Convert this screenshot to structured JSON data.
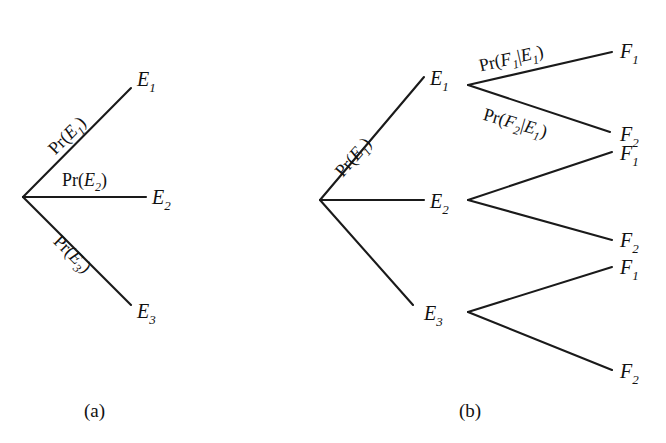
{
  "figure": {
    "background_color": "#ffffff",
    "ink_color": "#1a1a1a",
    "panels": [
      {
        "id": "a",
        "caption": "(a)",
        "description": "One-stage probability tree with three branches"
      },
      {
        "id": "b",
        "caption": "(b)",
        "description": "Two-stage probability tree with three first-stage branches each splitting into two"
      }
    ]
  },
  "panel_a": {
    "caption": "(a)",
    "branch_labels": {
      "top": {
        "pr": "Pr(",
        "arg": "E",
        "sub": "1",
        "close": ")"
      },
      "middle": {
        "pr": "Pr(",
        "arg": "E",
        "sub": "2",
        "close": ")"
      },
      "bottom": {
        "pr": "Pr(",
        "arg": "E",
        "sub": "3",
        "close": ")"
      }
    },
    "nodes": [
      {
        "symbol": "E",
        "sub": "1"
      },
      {
        "symbol": "E",
        "sub": "2"
      },
      {
        "symbol": "E",
        "sub": "3"
      }
    ]
  },
  "panel_b": {
    "caption": "(b)",
    "stage1_label": {
      "pr": "Pr(",
      "arg": "E",
      "sub": "1",
      "close": ")"
    },
    "stage1_nodes": [
      {
        "symbol": "E",
        "sub": "1"
      },
      {
        "symbol": "E",
        "sub": "2"
      },
      {
        "symbol": "E",
        "sub": "3"
      }
    ],
    "stage2_labels": [
      {
        "pr": "Pr(",
        "arg1": "F",
        "sub1": "1",
        "bar": "|",
        "arg2": "E",
        "sub2": "1",
        "close": ")"
      },
      {
        "pr": "Pr(",
        "arg1": "F",
        "sub1": "2",
        "bar": "|",
        "arg2": "E",
        "sub2": "1",
        "close": ")"
      }
    ],
    "stage2_nodes": [
      {
        "symbol": "F",
        "sub": "1"
      },
      {
        "symbol": "F",
        "sub": "2"
      },
      {
        "symbol": "F",
        "sub": "1"
      },
      {
        "symbol": "F",
        "sub": "2"
      },
      {
        "symbol": "F",
        "sub": "1"
      },
      {
        "symbol": "F",
        "sub": "2"
      }
    ]
  }
}
